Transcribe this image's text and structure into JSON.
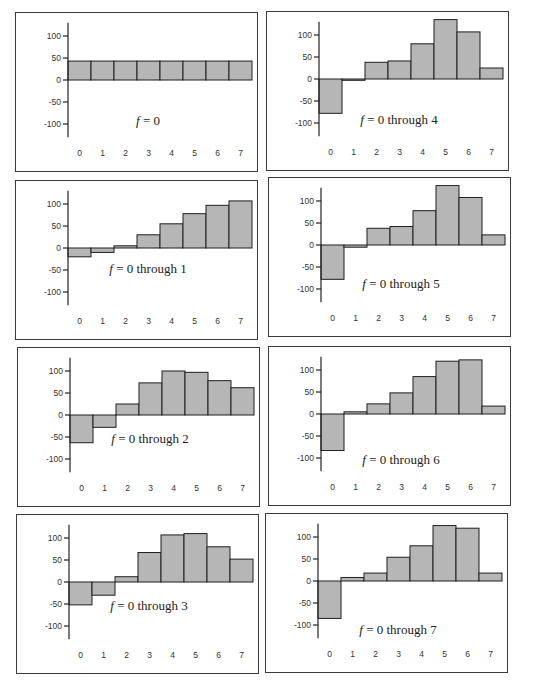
{
  "figure": {
    "panels_layout": "4 rows x 2 columns",
    "bar_color": "#b6b6b6",
    "border_color": "#1e1e1e"
  },
  "chart_data": [
    {
      "type": "bar",
      "title": "f = 0",
      "caption_var": "f",
      "caption_rest": " = 0",
      "categories": [
        "0",
        "1",
        "2",
        "3",
        "4",
        "5",
        "6",
        "7"
      ],
      "values": [
        43,
        43,
        43,
        43,
        43,
        43,
        43,
        43
      ],
      "yticks": [
        100,
        50,
        0,
        -50,
        -100
      ],
      "ytick_labels": [
        "100",
        "50",
        "0",
        "-50",
        "-100"
      ],
      "ylim": [
        -125,
        130
      ],
      "xlabel": "",
      "ylabel": "",
      "grid": false
    },
    {
      "type": "bar",
      "title": "f = 0 through 4",
      "caption_var": "f",
      "caption_rest": " = 0 through 4",
      "categories": [
        "0",
        "1",
        "2",
        "3",
        "4",
        "5",
        "6",
        "7"
      ],
      "values": [
        -78,
        -3,
        38,
        41,
        80,
        135,
        107,
        25
      ],
      "yticks": [
        100,
        50,
        0,
        -50,
        -100
      ],
      "ytick_labels": [
        "100",
        "50",
        "0",
        "-50",
        "-100"
      ],
      "ylim": [
        -125,
        130
      ],
      "xlabel": "",
      "ylabel": "",
      "grid": false
    },
    {
      "type": "bar",
      "title": "f = 0 through 1",
      "caption_var": "f",
      "caption_rest": " = 0 through 1",
      "categories": [
        "0",
        "1",
        "2",
        "3",
        "4",
        "5",
        "6",
        "7"
      ],
      "values": [
        -20,
        -10,
        5,
        30,
        55,
        78,
        97,
        107
      ],
      "yticks": [
        100,
        50,
        0,
        -50,
        -100
      ],
      "ytick_labels": [
        "100",
        "50",
        "0",
        "-50",
        "-100"
      ],
      "ylim": [
        -125,
        130
      ],
      "xlabel": "",
      "ylabel": "",
      "grid": false
    },
    {
      "type": "bar",
      "title": "f = 0 through 5",
      "caption_var": "f",
      "caption_rest": " = 0 through 5",
      "categories": [
        "0",
        "1",
        "2",
        "3",
        "4",
        "5",
        "6",
        "7"
      ],
      "values": [
        -78,
        -5,
        38,
        42,
        78,
        135,
        108,
        23
      ],
      "yticks": [
        100,
        50,
        0,
        -50,
        -100
      ],
      "ytick_labels": [
        "100",
        "50",
        "0",
        "-50",
        "-100"
      ],
      "ylim": [
        -125,
        130
      ],
      "xlabel": "",
      "ylabel": "",
      "grid": false
    },
    {
      "type": "bar",
      "title": "f = 0 through 2",
      "caption_var": "f",
      "caption_rest": " = 0 through 2",
      "categories": [
        "0",
        "1",
        "2",
        "3",
        "4",
        "5",
        "6",
        "7"
      ],
      "values": [
        -63,
        -28,
        25,
        73,
        100,
        97,
        78,
        62
      ],
      "yticks": [
        100,
        50,
        0,
        -50,
        -100
      ],
      "ytick_labels": [
        "100",
        "50",
        "0",
        "-50",
        "-100"
      ],
      "ylim": [
        -125,
        130
      ],
      "xlabel": "",
      "ylabel": "",
      "grid": false
    },
    {
      "type": "bar",
      "title": "f = 0 through 6",
      "caption_var": "f",
      "caption_rest": " = 0 through 6",
      "categories": [
        "0",
        "1",
        "2",
        "3",
        "4",
        "5",
        "6",
        "7"
      ],
      "values": [
        -83,
        5,
        23,
        48,
        85,
        120,
        123,
        18
      ],
      "yticks": [
        100,
        50,
        0,
        -50,
        -100
      ],
      "ytick_labels": [
        "100",
        "50",
        "0",
        "-50",
        "-100"
      ],
      "ylim": [
        -125,
        130
      ],
      "xlabel": "",
      "ylabel": "",
      "grid": false
    },
    {
      "type": "bar",
      "title": "f = 0 through 3",
      "caption_var": "f",
      "caption_rest": " = 0 through 3",
      "categories": [
        "0",
        "1",
        "2",
        "3",
        "4",
        "5",
        "6",
        "7"
      ],
      "values": [
        -52,
        -30,
        12,
        67,
        107,
        110,
        80,
        52
      ],
      "yticks": [
        100,
        50,
        0,
        -50,
        -100
      ],
      "ytick_labels": [
        "100",
        "50",
        "0",
        "-50",
        "-100"
      ],
      "ylim": [
        -125,
        130
      ],
      "xlabel": "",
      "ylabel": "",
      "grid": false
    },
    {
      "type": "bar",
      "title": "f = 0 through 7",
      "caption_var": "f",
      "caption_rest": " = 0 through 7",
      "categories": [
        "0",
        "1",
        "2",
        "3",
        "4",
        "5",
        "6",
        "7"
      ],
      "values": [
        -85,
        8,
        18,
        54,
        80,
        126,
        120,
        18
      ],
      "yticks": [
        100,
        50,
        0,
        -50,
        -100
      ],
      "ytick_labels": [
        "100",
        "50",
        "0",
        "-50",
        "-100"
      ],
      "ylim": [
        -125,
        130
      ],
      "xlabel": "",
      "ylabel": "",
      "grid": false
    }
  ]
}
